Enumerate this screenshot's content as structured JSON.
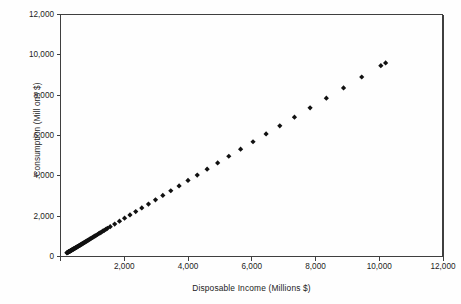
{
  "chart_data": {
    "type": "scatter",
    "title": "",
    "xlabel": "Disposable Income (Millions $)",
    "ylabel": "Consumption (Mill ons $)",
    "xlim": [
      0,
      12000
    ],
    "ylim": [
      0,
      12000
    ],
    "xticks": [
      0,
      2000,
      4000,
      6000,
      8000,
      10000,
      12000
    ],
    "xtick_labels": [
      "",
      "2,000",
      "4,000",
      "6,000",
      "8,000",
      "10,000",
      "12,000"
    ],
    "yticks": [
      0,
      2000,
      4000,
      6000,
      8000,
      10000,
      12000
    ],
    "ytick_labels": [
      "0",
      "2,000",
      "4,000",
      "6,000",
      "8,000",
      "10,000",
      "12,000"
    ],
    "grid": false,
    "legend": false,
    "marker": "diamond",
    "marker_color": "#111111",
    "marker_size": 2.6,
    "series": [
      {
        "name": "Consumption vs Disposable Income",
        "x": [
          200,
          215,
          228,
          240,
          252,
          263,
          275,
          286,
          298,
          310,
          322,
          334,
          347,
          360,
          373,
          386,
          400,
          414,
          428,
          443,
          458,
          474,
          490,
          507,
          524,
          542,
          560,
          579,
          598,
          618,
          639,
          660,
          682,
          705,
          729,
          753,
          778,
          804,
          831,
          859,
          888,
          918,
          949,
          981,
          1014,
          1048,
          1084,
          1121,
          1159,
          1199,
          1240,
          1283,
          1327,
          1373,
          1421,
          1470,
          1560,
          1700,
          1850,
          2010,
          2180,
          2360,
          2550,
          2760,
          2980,
          3210,
          3460,
          3720,
          4000,
          4290,
          4600,
          4930,
          5280,
          5650,
          6040,
          6450,
          6880,
          7340,
          7830,
          8340,
          8880,
          9450,
          10050,
          10200
        ],
        "y": [
          180,
          194,
          206,
          217,
          228,
          238,
          249,
          259,
          270,
          281,
          292,
          303,
          315,
          327,
          339,
          351,
          364,
          377,
          390,
          404,
          418,
          433,
          448,
          464,
          480,
          497,
          514,
          532,
          550,
          569,
          589,
          609,
          630,
          652,
          675,
          698,
          722,
          747,
          773,
          800,
          828,
          857,
          887,
          918,
          950,
          983,
          1018,
          1054,
          1091,
          1130,
          1170,
          1212,
          1255,
          1300,
          1347,
          1395,
          1480,
          1610,
          1750,
          1900,
          2060,
          2230,
          2410,
          2600,
          2810,
          3030,
          3260,
          3500,
          3770,
          4040,
          4330,
          4640,
          4970,
          5320,
          5690,
          6080,
          6480,
          6910,
          7370,
          7850,
          8360,
          8900,
          9460,
          9600
        ]
      }
    ]
  },
  "axes": {
    "frame_color": "#3f3f3f"
  }
}
